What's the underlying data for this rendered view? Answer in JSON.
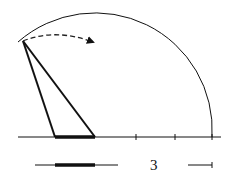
{
  "diagram": {
    "type": "geometric construction",
    "colors": {
      "stroke": "#111111",
      "background": "#ffffff"
    },
    "baseline": {
      "x1": 18,
      "x2": 221,
      "y": 137
    },
    "ticks_x": [
      136,
      175,
      212
    ],
    "arc": {
      "cx": 95,
      "cy": 137,
      "r": 117,
      "start": [
        23,
        41
      ],
      "end": [
        212,
        137
      ]
    },
    "triangle": {
      "apex": [
        23,
        41
      ],
      "base_left": [
        55,
        137
      ],
      "base_right": [
        95,
        137
      ]
    },
    "rotation_arrow": {
      "from": [
        23,
        41
      ],
      "to": [
        95,
        44
      ],
      "style": "dashed"
    },
    "legend_row": {
      "y": 165,
      "line": {
        "x1": 35,
        "x2": 118
      },
      "thick_segment": {
        "x1": 55,
        "x2": 95
      },
      "label": "3",
      "label_x": 154,
      "scale_bar": {
        "x1": 188,
        "x2": 212
      }
    }
  }
}
